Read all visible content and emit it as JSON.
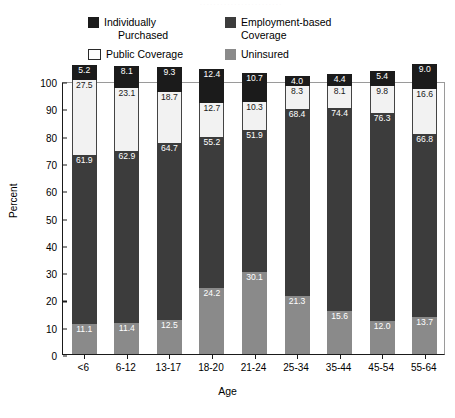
{
  "top_artifact": "· · · · · · · · · · · · · · · · · · · · · · · ·",
  "legend": {
    "individually_purchased": "Individually\nPurchased",
    "individually_purchased_line1": "Individually",
    "individually_purchased_line2": "Purchased",
    "employment_based": "Employment-based\nCoverage",
    "employment_based_line1": "Employment-based",
    "employment_based_line2": "Coverage",
    "public_coverage": "Public Coverage",
    "uninsured": "Uninsured"
  },
  "axis": {
    "ylabel": "Percent",
    "xlabel": "Age",
    "yticks": [
      "100",
      "90",
      "80",
      "70",
      "60",
      "50",
      "40",
      "30",
      "20",
      "10",
      "0"
    ]
  },
  "colors": {
    "individually_purchased": "#1b1b1b",
    "employment_based": "#3c3c3c",
    "public_coverage": "#f2f2f2",
    "uninsured": "#8a8a8a"
  },
  "chart_data": {
    "type": "bar",
    "stacked": true,
    "title": "",
    "xlabel": "Age",
    "ylabel": "Percent",
    "ylim": [
      0,
      100
    ],
    "ytick_step": 10,
    "grid": false,
    "legend_position": "top",
    "categories": [
      "<6",
      "6-12",
      "13-17",
      "18-20",
      "21-24",
      "25-34",
      "35-44",
      "45-54",
      "55-64"
    ],
    "series": [
      {
        "name": "Uninsured",
        "color": "#8a8a8a",
        "values": [
          11.1,
          11.4,
          12.5,
          24.2,
          30.1,
          21.3,
          15.6,
          12.0,
          13.7
        ],
        "labels": [
          "11.1",
          "11.4",
          "12.5",
          "24.2",
          "30.1",
          "21.3",
          "15.6",
          "12.0",
          "13.7"
        ]
      },
      {
        "name": "Employment-based Coverage",
        "color": "#3c3c3c",
        "values": [
          61.9,
          62.9,
          64.7,
          55.2,
          51.9,
          68.4,
          74.4,
          76.3,
          66.8
        ],
        "labels": [
          "61.9",
          "62.9",
          "64.7",
          "55.2",
          "51.9",
          "68.4",
          "74.4",
          "76.3",
          "66.8"
        ]
      },
      {
        "name": "Public Coverage",
        "color": "#f2f2f2",
        "values": [
          27.5,
          23.1,
          18.7,
          12.7,
          10.3,
          8.3,
          8.1,
          9.8,
          16.6
        ],
        "labels": [
          "27.5",
          "23.1",
          "18.7",
          "12.7",
          "10.3",
          "8.3",
          "8.1",
          "9.8",
          "16.6"
        ]
      },
      {
        "name": "Individually Purchased",
        "color": "#1b1b1b",
        "values": [
          5.2,
          8.1,
          9.3,
          12.4,
          10.7,
          4.0,
          4.4,
          5.4,
          9.0
        ],
        "labels": [
          "5.2",
          "8.1",
          "9.3",
          "12.4",
          "10.7",
          "4.0",
          "4.4",
          "5.4",
          "9.0"
        ]
      }
    ]
  }
}
